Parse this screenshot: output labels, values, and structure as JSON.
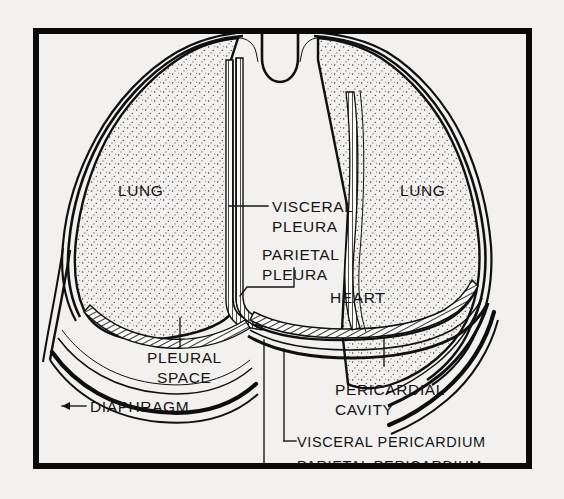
{
  "figure": {
    "caption_visible": false,
    "background_color": "#f2f1ef",
    "ink_color": "#141414",
    "frame": {
      "name": "figure-border",
      "x": 36,
      "y": 31,
      "width": 493,
      "height": 435,
      "stroke_color": "#0a0a0a",
      "stroke_width": 6
    }
  },
  "labels": {
    "lung_left": "LUNG",
    "lung_right": "LUNG",
    "visceral_pleura_line1": "VISCERAL",
    "visceral_pleura_line2": "PLEURA",
    "parietal_pleura_line1": "PARIETAL",
    "parietal_pleura_line2": "PLEURA",
    "heart": "HEART",
    "pleural_space_line1": "PLEURAL",
    "pleural_space_line2": "SPACE",
    "diaphragm": "DIAPHRAGM",
    "pericardial_cavity_line1": "PERICARDIAL",
    "pericardial_cavity_line2": "CAVITY",
    "visceral_pericardium": "VISCERAL PERICARDIUM",
    "parietal_pericardium": "PARIETAL PERICARDIUM"
  },
  "structures": [
    {
      "name": "lung-left",
      "label": "LUNG",
      "fill_style": "stipple"
    },
    {
      "name": "lung-right",
      "label": "LUNG",
      "fill_style": "stipple"
    },
    {
      "name": "visceral-pleura",
      "label": "VISCERAL PLEURA",
      "fill_style": "hatched-band"
    },
    {
      "name": "parietal-pleura",
      "label": "PARIETAL PLEURA",
      "fill_style": "hatched-band"
    },
    {
      "name": "pleural-space",
      "label": "PLEURAL SPACE",
      "fill_style": "open-gap"
    },
    {
      "name": "heart",
      "label": "HEART",
      "fill_style": "open"
    },
    {
      "name": "visceral-pericardium",
      "label": "VISCERAL PERICARDIUM",
      "fill_style": "hatched-band"
    },
    {
      "name": "parietal-pericardium",
      "label": "PARIETAL PERICARDIUM",
      "fill_style": "solid-line"
    },
    {
      "name": "pericardial-cavity",
      "label": "PERICARDIAL CAVITY",
      "fill_style": "open-gap"
    },
    {
      "name": "diaphragm",
      "label": "DIAPHRAGM",
      "fill_style": "heavy-line"
    },
    {
      "name": "trachea-notch",
      "label": "",
      "fill_style": "open"
    }
  ]
}
